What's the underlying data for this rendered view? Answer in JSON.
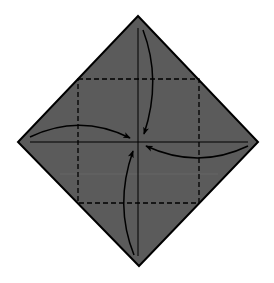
{
  "diagram": {
    "canvas": {
      "width": 274,
      "height": 283,
      "background": "#ffffff"
    },
    "paper": {
      "shape": "diamond",
      "vertices": {
        "top": [
          138,
          16
        ],
        "right": [
          258,
          142
        ],
        "bottom": [
          139,
          266
        ],
        "left": [
          18,
          142
        ]
      },
      "fill": "#5b5b5b",
      "stroke": "#000000"
    },
    "creases": {
      "vertical": {
        "x": 138,
        "y1": 28,
        "y2": 256,
        "style": "solid"
      },
      "horizontal": {
        "y": 142,
        "x1": 30,
        "x2": 248,
        "style": "solid"
      }
    },
    "fold_lines": {
      "style": "dashed",
      "square": {
        "x": 78,
        "y": 79,
        "width": 121,
        "height": 124
      }
    },
    "arrows": [
      {
        "name": "top-corner-arrow",
        "direction": "down",
        "from": [
          143,
          30
        ],
        "to": [
          144,
          135
        ]
      },
      {
        "name": "left-corner-arrow",
        "direction": "right",
        "from": [
          30,
          137
        ],
        "to": [
          131,
          138
        ]
      },
      {
        "name": "right-corner-arrow",
        "direction": "left",
        "from": [
          248,
          146
        ],
        "to": [
          145,
          146
        ]
      },
      {
        "name": "bottom-corner-arrow",
        "direction": "up",
        "from": [
          134,
          255
        ],
        "to": [
          133,
          150
        ]
      }
    ],
    "colors": {
      "paper": "#5b5b5b",
      "line": "#000000",
      "artifact": "#6e6e6e"
    }
  }
}
